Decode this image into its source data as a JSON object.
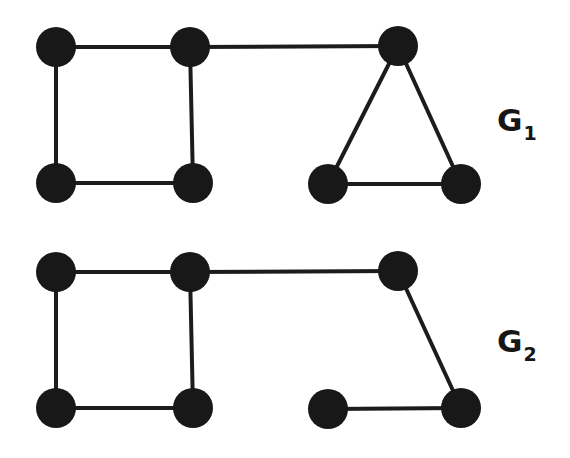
{
  "diagram": {
    "title": "",
    "colors": {
      "node": "#181818",
      "edge": "#1c1c1c",
      "label": "#161616",
      "background": "#ffffff"
    },
    "node_radius": 20,
    "graphs": [
      {
        "id": "G1",
        "label": {
          "main": "G",
          "sub": "1",
          "x": 497,
          "y": 105
        },
        "nodes": [
          {
            "id": "a",
            "x": 56,
            "y": 47
          },
          {
            "id": "b",
            "x": 190,
            "y": 47
          },
          {
            "id": "c",
            "x": 398,
            "y": 46
          },
          {
            "id": "d",
            "x": 56,
            "y": 183
          },
          {
            "id": "e",
            "x": 193,
            "y": 183
          },
          {
            "id": "f",
            "x": 328,
            "y": 184
          },
          {
            "id": "g",
            "x": 461,
            "y": 184
          }
        ],
        "edges": [
          [
            "a",
            "b"
          ],
          [
            "b",
            "c"
          ],
          [
            "a",
            "d"
          ],
          [
            "b",
            "e"
          ],
          [
            "d",
            "e"
          ],
          [
            "c",
            "f"
          ],
          [
            "c",
            "g"
          ],
          [
            "f",
            "g"
          ]
        ]
      },
      {
        "id": "G2",
        "label": {
          "main": "G",
          "sub": "2",
          "x": 497,
          "y": 326
        },
        "nodes": [
          {
            "id": "a",
            "x": 56,
            "y": 272
          },
          {
            "id": "b",
            "x": 190,
            "y": 272
          },
          {
            "id": "c",
            "x": 398,
            "y": 271
          },
          {
            "id": "d",
            "x": 56,
            "y": 408
          },
          {
            "id": "e",
            "x": 193,
            "y": 408
          },
          {
            "id": "f",
            "x": 328,
            "y": 409
          },
          {
            "id": "g",
            "x": 461,
            "y": 408
          }
        ],
        "edges": [
          [
            "a",
            "b"
          ],
          [
            "b",
            "c"
          ],
          [
            "a",
            "d"
          ],
          [
            "b",
            "e"
          ],
          [
            "d",
            "e"
          ],
          [
            "c",
            "g"
          ],
          [
            "f",
            "g"
          ]
        ]
      }
    ]
  }
}
